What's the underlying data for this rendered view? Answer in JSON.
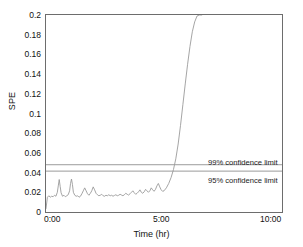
{
  "chart_data": {
    "type": "line",
    "title": "",
    "xlabel": "Time (hr)",
    "ylabel": "SPE",
    "xlim": [
      0,
      10
    ],
    "ylim": [
      0,
      0.2
    ],
    "grid": false,
    "legend": "none",
    "xtick_labels": [
      "0:00",
      "5:00",
      "10:00"
    ],
    "xtick_values": [
      0,
      5,
      10
    ],
    "ytick_labels": [
      "0",
      "0.02",
      "0.04",
      "0.06",
      "0.08",
      "0.1",
      "0.12",
      "0.14",
      "0.16",
      "0.18",
      "0.2"
    ],
    "ytick_values": [
      0,
      0.02,
      0.04,
      0.06,
      0.08,
      0.1,
      0.12,
      0.14,
      0.16,
      0.18,
      0.2
    ],
    "series": [
      {
        "name": "SPE",
        "color": "#9b9b9b",
        "x": [
          0.0,
          0.06,
          0.12,
          0.18,
          0.24,
          0.3,
          0.36,
          0.42,
          0.48,
          0.52,
          0.56,
          0.6,
          0.64,
          0.7,
          0.76,
          0.82,
          0.88,
          0.94,
          1.0,
          1.04,
          1.08,
          1.12,
          1.16,
          1.22,
          1.28,
          1.34,
          1.4,
          1.46,
          1.52,
          1.58,
          1.64,
          1.7,
          1.76,
          1.82,
          1.88,
          1.94,
          2.0,
          2.06,
          2.12,
          2.18,
          2.24,
          2.3,
          2.36,
          2.42,
          2.48,
          2.54,
          2.6,
          2.66,
          2.72,
          2.78,
          2.84,
          2.9,
          2.96,
          3.02,
          3.08,
          3.14,
          3.2,
          3.26,
          3.32,
          3.38,
          3.44,
          3.5,
          3.56,
          3.62,
          3.68,
          3.74,
          3.8,
          3.86,
          3.92,
          3.98,
          4.04,
          4.1,
          4.16,
          4.22,
          4.28,
          4.34,
          4.4,
          4.46,
          4.52,
          4.58,
          4.64,
          4.7,
          4.76,
          4.82,
          4.88,
          4.94,
          5.0,
          5.1,
          5.2,
          5.3,
          5.4,
          5.5,
          5.6,
          5.7,
          5.8,
          5.9,
          6.0,
          6.1,
          6.2,
          6.3,
          6.4,
          6.5,
          6.6
        ],
        "y": [
          0.0035,
          0.015,
          0.0165,
          0.015,
          0.016,
          0.0155,
          0.017,
          0.016,
          0.02,
          0.0265,
          0.033,
          0.026,
          0.0195,
          0.016,
          0.017,
          0.0155,
          0.0165,
          0.0175,
          0.0215,
          0.029,
          0.0335,
          0.028,
          0.02,
          0.017,
          0.016,
          0.0165,
          0.015,
          0.016,
          0.0185,
          0.0215,
          0.0245,
          0.0215,
          0.0185,
          0.017,
          0.019,
          0.0215,
          0.0255,
          0.0225,
          0.019,
          0.0175,
          0.0165,
          0.017,
          0.018,
          0.0165,
          0.016,
          0.017,
          0.0165,
          0.0175,
          0.0165,
          0.017,
          0.016,
          0.0168,
          0.0175,
          0.0165,
          0.017,
          0.018,
          0.0172,
          0.0165,
          0.0175,
          0.019,
          0.018,
          0.0172,
          0.0185,
          0.02,
          0.0215,
          0.0195,
          0.018,
          0.019,
          0.0205,
          0.0225,
          0.02,
          0.019,
          0.0205,
          0.023,
          0.0215,
          0.02,
          0.0215,
          0.0245,
          0.0225,
          0.021,
          0.023,
          0.0265,
          0.029,
          0.0255,
          0.0225,
          0.021,
          0.0215,
          0.0245,
          0.029,
          0.035,
          0.043,
          0.054,
          0.069,
          0.088,
          0.109,
          0.13,
          0.15,
          0.168,
          0.183,
          0.193,
          0.199,
          0.2,
          0.2
        ]
      }
    ],
    "reference_lines": [
      {
        "name": "99% confidence limit",
        "value": 0.048,
        "label": "99% confidence limit",
        "style": "solid",
        "color": "#8f8f8f"
      },
      {
        "name": "95% confidence limit",
        "value": 0.0415,
        "label": "95% confidence limit",
        "style": "solid",
        "color": "#8f8f8f"
      }
    ]
  }
}
